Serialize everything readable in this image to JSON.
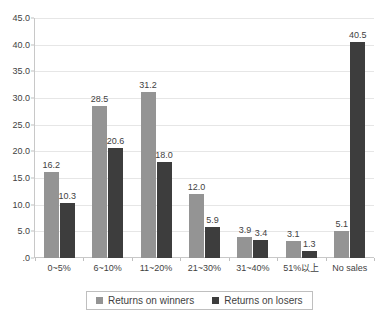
{
  "chart_data": {
    "type": "bar",
    "title": "",
    "subtitle": "",
    "xlabel": "",
    "ylabel": "",
    "ylim": [
      0,
      45
    ],
    "ytick_step": 5,
    "ytick_labels": [
      "45.0",
      "40.0",
      "35.0",
      "30.0",
      "25.0",
      "20.0",
      "15.0",
      "10.0",
      "5.0",
      ".0"
    ],
    "ytick_values": [
      45,
      40,
      35,
      30,
      25,
      20,
      15,
      10,
      5,
      0
    ],
    "grid": true,
    "legend_position": "bottom",
    "categories": [
      "0~5%",
      "6~10%",
      "11~20%",
      "21~30%",
      "31~40%",
      "51%以上",
      "No sales"
    ],
    "series": [
      {
        "name": "Returns on winners",
        "color": "#949494",
        "values": [
          16.2,
          28.5,
          31.2,
          12.0,
          3.9,
          3.1,
          5.1
        ],
        "labels": [
          "16.2",
          "28.5",
          "31.2",
          "12.0",
          "3.9",
          "3.1",
          "5.1"
        ]
      },
      {
        "name": "Returns on losers",
        "color": "#3d3d3d",
        "values": [
          10.3,
          20.6,
          18.0,
          5.9,
          3.4,
          1.3,
          40.5
        ],
        "labels": [
          "10.3",
          "20.6",
          "18.0",
          "5.9",
          "3.4",
          "1.3",
          "40.5"
        ]
      }
    ]
  },
  "legend": {
    "items": [
      {
        "label": "Returns on winners",
        "color": "#949494"
      },
      {
        "label": "Returns on losers",
        "color": "#3d3d3d"
      }
    ]
  },
  "colors": {
    "winners": "#949494",
    "losers": "#3d3d3d",
    "gridline": "#e6e6e6",
    "axis": "#c8c8c8",
    "text": "#3f3f3f",
    "background": "#ffffff"
  }
}
